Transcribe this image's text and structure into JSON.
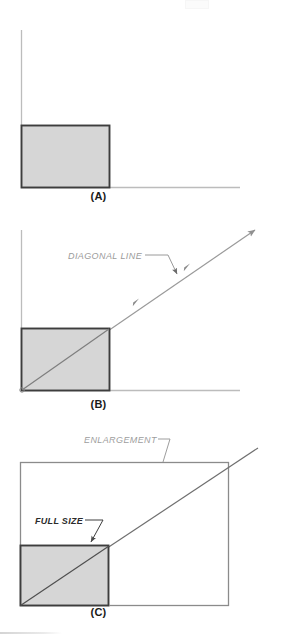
{
  "figure": {
    "type": "technical-illustration",
    "background_color": "#ffffff",
    "shape_fill_color": "#d6d6d6",
    "shape_stroke_color": "#3b3b3b",
    "axis_color": "#b8b8b8",
    "annotation_color": "#8e8e8e",
    "outline_color": "#7a7a7a",
    "panels": [
      {
        "id": "A",
        "caption": "(A)",
        "description": "Original rectangle placed against vertical and horizontal reference axes",
        "elements": {
          "vertical_axis": "vertical-axis-line",
          "horizontal_axis": "horizontal-axis-line",
          "rectangle": "original-rectangle"
        },
        "annotations": []
      },
      {
        "id": "B",
        "caption": "(B)",
        "description": "Diagonal line drawn through the rectangle corner and extended outward",
        "elements": {
          "vertical_axis": "vertical-axis-line",
          "horizontal_axis": "horizontal-axis-line",
          "rectangle": "original-rectangle",
          "diagonal": "diagonal-line"
        },
        "annotations": [
          {
            "label": "DIAGONAL LINE",
            "points_to": "diagonal-line"
          }
        ]
      },
      {
        "id": "C",
        "caption": "(C)",
        "description": "Enlarged rectangle sharing the same diagonal, original shown shaded at lower left",
        "elements": {
          "rectangle_small": "full-size-rectangle",
          "rectangle_large": "enlargement-rectangle",
          "diagonal": "diagonal-line"
        },
        "annotations": [
          {
            "label": "ENLARGEMENT",
            "points_to": "enlargement-rectangle"
          },
          {
            "label": "FULL SIZE",
            "points_to": "full-size-rectangle"
          }
        ]
      }
    ]
  },
  "labels": {
    "caption_a": "(A)",
    "caption_b": "(B)",
    "caption_c": "(C)",
    "diagonal_line": "DIAGONAL LINE",
    "enlargement": "ENLARGEMENT",
    "full_size": "FULL SIZE"
  }
}
